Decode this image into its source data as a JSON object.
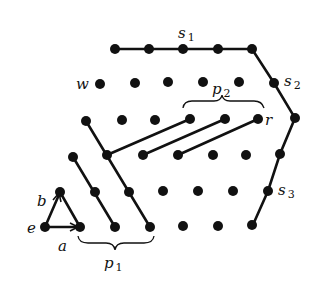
{
  "diagram": {
    "labels": {
      "s1": {
        "base": "s",
        "sub": "1"
      },
      "s2": {
        "base": "s",
        "sub": "2"
      },
      "s3": {
        "base": "s",
        "sub": "3"
      },
      "p1": {
        "base": "p",
        "sub": "1"
      },
      "p2": {
        "base": "p",
        "sub": "2"
      },
      "w": "w",
      "r": "r",
      "a": "a",
      "b": "b",
      "e": "e"
    },
    "colors": {
      "ink": "#111111",
      "background": "#ffffff"
    }
  }
}
